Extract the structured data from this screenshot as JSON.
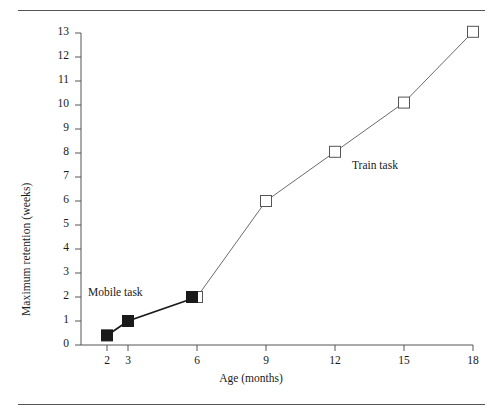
{
  "chart_data": {
    "type": "line",
    "title": "",
    "xlabel": "Age (months)",
    "ylabel": "Maximum retention (weeks)",
    "x_tick_labels": [
      "2",
      "3",
      "6",
      "9",
      "12",
      "15",
      "18"
    ],
    "x_tick_values": [
      2,
      3,
      6,
      9,
      12,
      15,
      18
    ],
    "y_tick_labels": [
      "0",
      "1",
      "2",
      "3",
      "4",
      "5",
      "6",
      "7",
      "8",
      "9",
      "10",
      "11",
      "12",
      "13"
    ],
    "y_tick_values": [
      0,
      1,
      2,
      3,
      4,
      5,
      6,
      7,
      8,
      9,
      10,
      11,
      12,
      13
    ],
    "ylim": [
      0,
      13
    ],
    "x_scale": "categorical-ordinal",
    "grid": false,
    "legend_position": "inline-annotation",
    "series": [
      {
        "name": "Mobile task",
        "marker": "filled-square",
        "marker_color": "#1a1a1a",
        "line_color": "#1a1a1a",
        "line_width": 1.8,
        "x": [
          2,
          3,
          6
        ],
        "values": [
          0.4,
          1.0,
          2.0
        ]
      },
      {
        "name": "Train task",
        "marker": "open-square",
        "marker_color": "#ffffff",
        "marker_edge_color": "#555555",
        "line_color": "#6b6b6b",
        "line_width": 1.0,
        "x": [
          6,
          9,
          12,
          15,
          18
        ],
        "values": [
          2.0,
          6.0,
          8.05,
          10.1,
          13.05
        ]
      }
    ],
    "annotations": [
      {
        "text": "Mobile task",
        "x": 2.6,
        "y": 2.5
      },
      {
        "text": "Train task",
        "x": 12.9,
        "y": 7.8
      }
    ]
  },
  "figure": {
    "top_rule": "horizontal-rule",
    "bottom_rule": "horizontal-rule"
  }
}
